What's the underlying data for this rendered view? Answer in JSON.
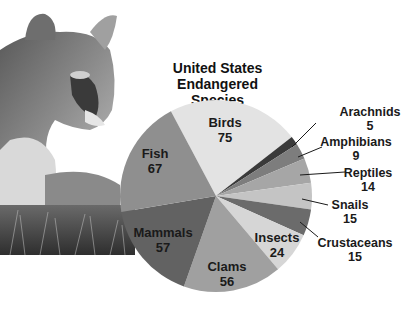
{
  "chart_data": {
    "type": "pie",
    "title": "United States Endangered Species",
    "title_lines": [
      "United States",
      "Endangered Species"
    ],
    "categories": [
      "Birds",
      "Arachnids",
      "Amphibians",
      "Reptiles",
      "Snails",
      "Crustaceans",
      "Insects",
      "Clams",
      "Mammals",
      "Fish"
    ],
    "values": [
      75,
      5,
      9,
      14,
      15,
      15,
      24,
      56,
      57,
      67
    ],
    "colors": [
      "#e3e3e3",
      "#3a3a3a",
      "#7d7d7d",
      "#a6a6a6",
      "#c4c4c4",
      "#6b6b6b",
      "#d6d6d6",
      "#a0a0a0",
      "#626262",
      "#8f8f8f"
    ],
    "start_angle_deg": -28,
    "legend": "none (leader-line labels)"
  },
  "labels": {
    "birds": {
      "name": "Birds",
      "value": "75"
    },
    "fish": {
      "name": "Fish",
      "value": "67"
    },
    "mammals": {
      "name": "Mammals",
      "value": "57"
    },
    "clams": {
      "name": "Clams",
      "value": "56"
    },
    "insects": {
      "name": "Insects",
      "value": "24"
    },
    "arachnids": {
      "name": "Arachnids",
      "value": "5"
    },
    "amphibians": {
      "name": "Amphibians",
      "value": "9"
    },
    "reptiles": {
      "name": "Reptiles",
      "value": "14"
    },
    "snails": {
      "name": "Snails",
      "value": "15"
    },
    "crustaceans": {
      "name": "Crustaceans",
      "value": "15"
    }
  },
  "image": {
    "subject": "cougar photograph"
  }
}
